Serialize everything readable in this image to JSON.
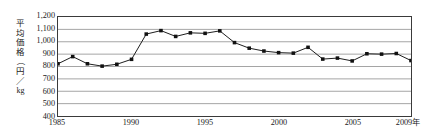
{
  "chart_data": {
    "type": "line",
    "title": "",
    "subtitle": "",
    "xlabel": "",
    "ylabel": "平均価格（円／kg）",
    "ylabel_chars": [
      "平",
      "均",
      "価",
      "格",
      "（",
      "円",
      "／",
      "kg",
      "）"
    ],
    "x_axis_unit_suffix": "年",
    "xlim": [
      1985,
      2009
    ],
    "ylim": [
      400,
      1200
    ],
    "y_ticks": [
      1200,
      1100,
      1000,
      900,
      800,
      700,
      600,
      500,
      400
    ],
    "y_tick_labels": [
      "1,200",
      "1,100",
      "1,000",
      "900",
      "800",
      "700",
      "600",
      "500",
      "400"
    ],
    "x_ticks": [
      1985,
      1990,
      1995,
      2000,
      2005,
      2009
    ],
    "x_tick_labels": [
      "1985",
      "1990",
      "1995",
      "2000",
      "2005",
      "2009年"
    ],
    "grid": true,
    "grid_axis": "y",
    "legend": false,
    "legend_position": "none",
    "marker": "square",
    "line_color": "#1a1a1a",
    "marker_color": "#111111",
    "grid_color": "#9a9a9a",
    "frame_color": "#3a3a3a",
    "x": [
      1985,
      1986,
      1987,
      1988,
      1989,
      1990,
      1991,
      1992,
      1993,
      1994,
      1995,
      1996,
      1997,
      1998,
      1999,
      2000,
      2001,
      2002,
      2003,
      2004,
      2005,
      2006,
      2007,
      2008,
      2009
    ],
    "values": [
      822,
      880,
      822,
      803,
      818,
      858,
      1062,
      1090,
      1043,
      1072,
      1068,
      1088,
      993,
      948,
      925,
      912,
      908,
      955,
      860,
      868,
      845,
      903,
      900,
      905,
      848
    ]
  }
}
